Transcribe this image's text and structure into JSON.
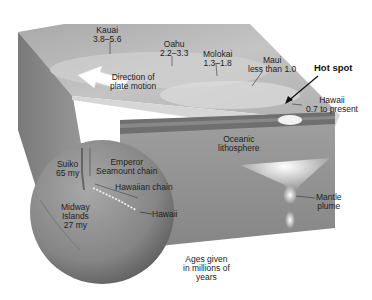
{
  "diagram": {
    "type": "block-diagram-with-globe",
    "colors": {
      "surface": "#b8b8b8",
      "ocean_floor_light": "#d9d9d9",
      "block_side": "#8e8e8e",
      "lithosphere_band": "#6f6f6f",
      "mantle": "#9a9a9a",
      "plume_glow": "#f4f4f4",
      "globe": "#8c8c8c",
      "arrow": "#ffffff",
      "text": "#222222"
    },
    "islands": [
      {
        "name": "Kauai",
        "age": "3.8–5.6"
      },
      {
        "name": "Oahu",
        "age": "2.2–3.3"
      },
      {
        "name": "Molokai",
        "age": "1.3–1.8"
      },
      {
        "name": "Maui",
        "age": "less than 1.0"
      },
      {
        "name": "Hawaii",
        "age": "0.7 to present"
      }
    ],
    "labels": {
      "plate_motion_line1": "Direction of",
      "plate_motion_line2": "plate motion",
      "hot_spot": "Hot spot",
      "lithosphere_line1": "Oceanic",
      "lithosphere_line2": "lithosphere",
      "plume_line1": "Mantle",
      "plume_line2": "plume"
    },
    "globe_labels": {
      "suiko_name": "Suiko",
      "suiko_age": "65 my",
      "emperor_line1": "Emperor",
      "emperor_line2": "Seamount chain",
      "hawaiian_chain": "Hawaiian chain",
      "hawaii": "Hawaii",
      "midway_line1": "Midway",
      "midway_line2": "Islands",
      "midway_age": "27 my"
    },
    "footnote": {
      "line1": "Ages given",
      "line2": "in millions of",
      "line3": "years"
    }
  }
}
